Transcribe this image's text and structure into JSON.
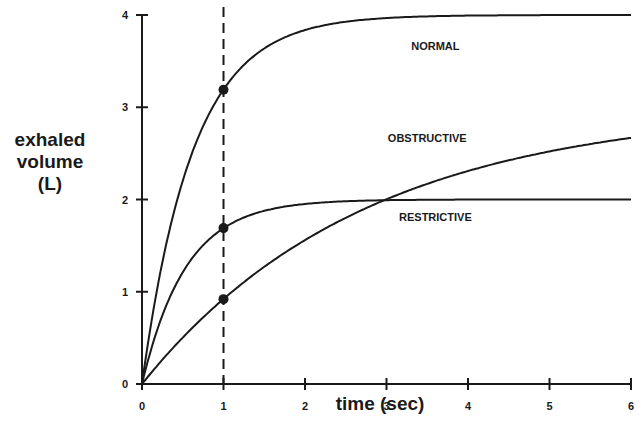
{
  "chart_data": {
    "type": "line",
    "title": "",
    "xlabel": "time (sec)",
    "ylabel": "exhaled volume (L)",
    "ylabel_lines": [
      "exhaled",
      "volume",
      "(L)"
    ],
    "xlim": [
      0,
      6
    ],
    "ylim": [
      0,
      4
    ],
    "x_ticks": [
      0,
      1,
      2,
      3,
      4,
      5,
      6
    ],
    "y_ticks": [
      0,
      1,
      2,
      3,
      4
    ],
    "grid": false,
    "legend": "inline labels",
    "reference_line": {
      "x": 1,
      "style": "dashed"
    },
    "series": [
      {
        "name": "NORMAL",
        "label_pos": {
          "t": 3.6,
          "v": 3.62
        },
        "model": {
          "A": 4.0,
          "k": 1.6
        },
        "x": [
          0,
          0.5,
          1,
          1.5,
          2,
          3,
          4,
          5,
          6
        ],
        "values": [
          0,
          2.2,
          3.19,
          3.64,
          3.84,
          3.97,
          4.0,
          4.0,
          4.0
        ],
        "marker_at_1s": 3.19
      },
      {
        "name": "OBSTRUCTIVE",
        "label_pos": {
          "t": 3.5,
          "v": 2.62
        },
        "model": {
          "A": 3.0,
          "k": 0.367
        },
        "x": [
          0,
          0.5,
          1,
          1.5,
          2,
          3,
          4,
          5,
          6
        ],
        "values": [
          0,
          0.5,
          0.92,
          1.27,
          1.56,
          2.0,
          2.31,
          2.52,
          2.63
        ],
        "marker_at_1s": 0.92
      },
      {
        "name": "RESTRICTIVE",
        "label_pos": {
          "t": 3.6,
          "v": 1.77
        },
        "model": {
          "A": 2.0,
          "k": 1.86
        },
        "x": [
          0,
          0.5,
          1,
          1.5,
          2,
          3,
          4,
          5,
          6
        ],
        "values": [
          0,
          1.21,
          1.69,
          1.88,
          1.95,
          1.99,
          2.0,
          2.0,
          2.0
        ],
        "marker_at_1s": 1.69
      }
    ]
  },
  "layout": {
    "origin_px": [
      142,
      384
    ],
    "px_per_x": 81.5,
    "px_per_y": 92.25,
    "line_color": "#1a1a1a"
  }
}
